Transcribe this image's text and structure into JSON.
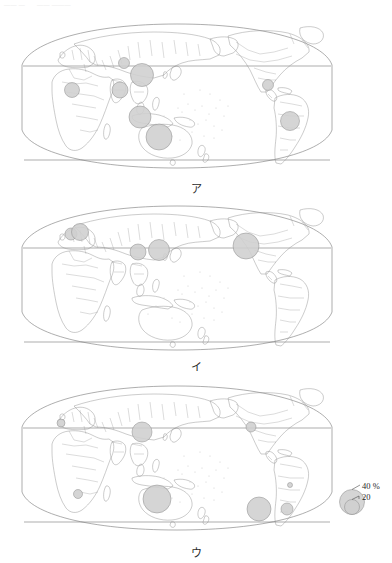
{
  "page_header": {
    "segments": [
      "—— —",
      "—— ———"
    ]
  },
  "legend": {
    "upper_label": "40 %",
    "lower_label": "20",
    "upper_value": 40,
    "lower_value": 20,
    "unit": "%"
  },
  "figures": [
    {
      "id": "map-a",
      "caption": "ア",
      "bubbles": [
        {
          "name": "west-africa",
          "cx": 58,
          "cy": 70,
          "r": 7.5
        },
        {
          "name": "central-asia",
          "cx": 110,
          "cy": 43,
          "r": 5.5
        },
        {
          "name": "china",
          "cx": 128,
          "cy": 55,
          "r": 11.5
        },
        {
          "name": "india",
          "cx": 106,
          "cy": 70,
          "r": 8.0
        },
        {
          "name": "indonesia",
          "cx": 126,
          "cy": 97,
          "r": 11.0
        },
        {
          "name": "australia",
          "cx": 145,
          "cy": 117,
          "r": 13.0
        },
        {
          "name": "colombia-venezuela",
          "cx": 254,
          "cy": 65,
          "r": 5.5
        },
        {
          "name": "brazil",
          "cx": 276,
          "cy": 101,
          "r": 9.5
        }
      ]
    },
    {
      "id": "map-b",
      "caption": "イ",
      "bubbles": [
        {
          "name": "western-europe",
          "cx": 57,
          "cy": 32,
          "r": 6.0
        },
        {
          "name": "central-europe",
          "cx": 66,
          "cy": 30,
          "r": 8.5
        },
        {
          "name": "china",
          "cx": 124,
          "cy": 50,
          "r": 8.0
        },
        {
          "name": "japan-korea",
          "cx": 145,
          "cy": 48,
          "r": 10.5
        },
        {
          "name": "united-states",
          "cx": 232,
          "cy": 44,
          "r": 13.0
        }
      ]
    },
    {
      "id": "map-c",
      "caption": "ウ",
      "bubbles": [
        {
          "name": "morocco",
          "cx": 47,
          "cy": 41,
          "r": 4.0
        },
        {
          "name": "china",
          "cx": 128,
          "cy": 50,
          "r": 10.0
        },
        {
          "name": "south-africa",
          "cx": 64,
          "cy": 112,
          "r": 4.5
        },
        {
          "name": "australia",
          "cx": 143,
          "cy": 117,
          "r": 14.0
        },
        {
          "name": "united-states",
          "cx": 237,
          "cy": 45,
          "r": 5.0
        },
        {
          "name": "brazil",
          "cx": 276,
          "cy": 103,
          "r": 2.5
        },
        {
          "name": "chile",
          "cx": 245,
          "cy": 127,
          "r": 12.0
        },
        {
          "name": "argentina",
          "cx": 273,
          "cy": 127,
          "r": 6.0
        }
      ]
    }
  ]
}
